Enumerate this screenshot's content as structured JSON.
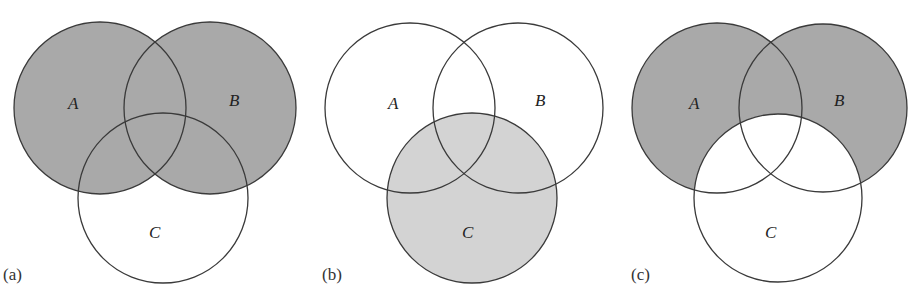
{
  "figure": {
    "panels": [
      {
        "id": "a",
        "label": "(a)",
        "description": "A ∪ B shaded",
        "shade_color": "#a9a9a9",
        "sets": {
          "A": "A",
          "B": "B",
          "C": "C"
        }
      },
      {
        "id": "b",
        "label": "(b)",
        "description": "C shaded",
        "shade_color": "#d3d3d3",
        "sets": {
          "A": "A",
          "B": "B",
          "C": "C"
        }
      },
      {
        "id": "c",
        "label": "(c)",
        "description": "(A ∪ B) − C shaded",
        "shade_color": "#a9a9a9",
        "sets": {
          "A": "A",
          "B": "B",
          "C": "C"
        }
      }
    ]
  }
}
